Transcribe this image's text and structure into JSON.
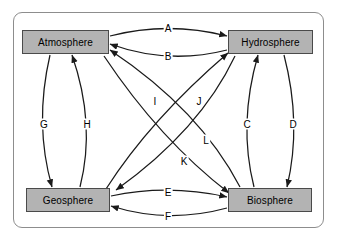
{
  "diagram": {
    "frame": {
      "border_color": "#8d8d8d",
      "background": "#ffffff"
    },
    "node_style": {
      "fill": "#b3b3b3",
      "stroke": "#4a4a4a",
      "text_color": "#000000"
    },
    "edge_style": {
      "stroke": "#1a1a1a",
      "arrowhead": "filled-triangle"
    },
    "nodes": [
      {
        "id": "atmosphere",
        "label": "Atmosphere"
      },
      {
        "id": "hydrosphere",
        "label": "Hydrosphere"
      },
      {
        "id": "geosphere",
        "label": "Geosphere"
      },
      {
        "id": "biosphere",
        "label": "Biosphere"
      }
    ],
    "edges": [
      {
        "label": "A",
        "from": "atmosphere",
        "to": "hydrosphere"
      },
      {
        "label": "B",
        "from": "hydrosphere",
        "to": "atmosphere"
      },
      {
        "label": "C",
        "from": "biosphere",
        "to": "hydrosphere"
      },
      {
        "label": "D",
        "from": "hydrosphere",
        "to": "biosphere"
      },
      {
        "label": "E",
        "from": "geosphere",
        "to": "biosphere"
      },
      {
        "label": "F",
        "from": "biosphere",
        "to": "geosphere"
      },
      {
        "label": "G",
        "from": "atmosphere",
        "to": "geosphere"
      },
      {
        "label": "H",
        "from": "geosphere",
        "to": "atmosphere"
      },
      {
        "label": "I",
        "from": "geosphere",
        "to": "hydrosphere"
      },
      {
        "label": "J",
        "from": "hydrosphere",
        "to": "geosphere"
      },
      {
        "label": "K",
        "from": "atmosphere",
        "to": "biosphere"
      },
      {
        "label": "L",
        "from": "biosphere",
        "to": "atmosphere"
      }
    ],
    "edge_labels": [
      {
        "label": "A",
        "x": 168,
        "y": 28
      },
      {
        "label": "B",
        "x": 168,
        "y": 56
      },
      {
        "label": "C",
        "x": 247,
        "y": 124
      },
      {
        "label": "D",
        "x": 293,
        "y": 124
      },
      {
        "label": "E",
        "x": 168,
        "y": 192
      },
      {
        "label": "F",
        "x": 168,
        "y": 216
      },
      {
        "label": "G",
        "x": 44,
        "y": 124
      },
      {
        "label": "H",
        "x": 87,
        "y": 124
      },
      {
        "label": "I",
        "x": 155,
        "y": 101
      },
      {
        "label": "J",
        "x": 199,
        "y": 101
      },
      {
        "label": "K",
        "x": 184,
        "y": 161
      },
      {
        "label": "L",
        "x": 206,
        "y": 140
      }
    ]
  }
}
